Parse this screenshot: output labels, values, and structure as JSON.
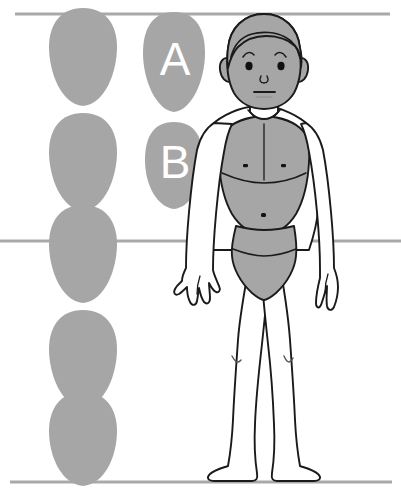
{
  "figure": {
    "background_color": "#ffffff",
    "shape_fill": "#a6a6a6",
    "outline_color": "#1a1a1a",
    "guide_line_color": "#a9a9a9"
  },
  "guides": {
    "name": "horizontal-guide-lines",
    "count": 3,
    "lines": [
      {
        "id": "top",
        "y": 14,
        "x1": 15,
        "x2": 390,
        "label": "top of head"
      },
      {
        "id": "middle",
        "y": 241,
        "x1": 0,
        "x2": 401,
        "label": "mid-body"
      },
      {
        "id": "bottom",
        "y": 482,
        "x1": 10,
        "x2": 392,
        "label": "sole of foot"
      }
    ]
  },
  "head_stack": {
    "name": "head-height-measuring-column",
    "count": 5,
    "unit_label": "head height",
    "units": [
      {
        "index": 1,
        "cx": 83,
        "cy": 57
      },
      {
        "index": 2,
        "cx": 83,
        "cy": 163
      },
      {
        "index": 3,
        "cx": 83,
        "cy": 268
      },
      {
        "index": 4,
        "cx": 83,
        "cy": 373
      },
      {
        "index": 5,
        "cx": 83,
        "cy": 440
      }
    ]
  },
  "reference_shapes": [
    {
      "id": "A",
      "name": "reference-head-shape-a",
      "label": "A",
      "cx": 174,
      "cy": 62,
      "width": 58,
      "height": 100,
      "description": "tall narrow egg, tapering downward"
    },
    {
      "id": "B",
      "name": "reference-head-shape-b",
      "label": "B",
      "cx": 174,
      "cy": 165,
      "width": 56,
      "height": 88,
      "description": "shorter rounder egg"
    }
  ],
  "body_figure": {
    "name": "standing-child-figure",
    "pose": "standing frontal, arms at sides, legs apart",
    "parts": [
      {
        "name": "hair",
        "fill": "#a6a6a6"
      },
      {
        "name": "face",
        "fill": "#a6a6a6"
      },
      {
        "name": "ear-left",
        "fill": "#a6a6a6"
      },
      {
        "name": "ear-right",
        "fill": "#a6a6a6"
      },
      {
        "name": "eye-left",
        "fill": "#111111"
      },
      {
        "name": "eye-right",
        "fill": "#111111"
      },
      {
        "name": "eyebrow-left",
        "fill": "none"
      },
      {
        "name": "eyebrow-right",
        "fill": "none"
      },
      {
        "name": "nose",
        "fill": "none"
      },
      {
        "name": "mouth",
        "fill": "none"
      },
      {
        "name": "neck",
        "fill": "#ffffff"
      },
      {
        "name": "torso-shading",
        "fill": "#a6a6a6"
      },
      {
        "name": "nipple-left",
        "fill": "#111111"
      },
      {
        "name": "nipple-right",
        "fill": "#111111"
      },
      {
        "name": "navel",
        "fill": "#111111"
      },
      {
        "name": "underwear",
        "fill": "#a6a6a6"
      },
      {
        "name": "arm-left",
        "fill": "#ffffff"
      },
      {
        "name": "arm-right",
        "fill": "#ffffff"
      },
      {
        "name": "hand-left",
        "fill": "#ffffff"
      },
      {
        "name": "hand-right",
        "fill": "#ffffff"
      },
      {
        "name": "leg-left",
        "fill": "#ffffff"
      },
      {
        "name": "leg-right",
        "fill": "#ffffff"
      },
      {
        "name": "foot-left",
        "fill": "#ffffff"
      },
      {
        "name": "foot-right",
        "fill": "#ffffff"
      }
    ]
  }
}
